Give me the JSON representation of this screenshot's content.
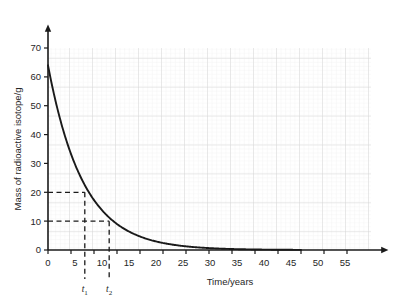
{
  "chart_data": {
    "type": "line",
    "title": "",
    "subtitle": "",
    "xlabel": "Time/years",
    "ylabel": "Mass of radioactive isotope/g",
    "xlim": [
      0,
      57
    ],
    "ylim": [
      0,
      73
    ],
    "xticks": [
      0,
      5,
      10,
      15,
      20,
      25,
      30,
      35,
      40,
      45,
      50,
      55
    ],
    "yticks": [
      0,
      10,
      20,
      30,
      40,
      50,
      60,
      70
    ],
    "grid": true,
    "grid_minor": true,
    "legend": "none",
    "curve_color": "#1a1a1a",
    "series": [
      {
        "name": "Mass of radioactive isotope",
        "initial_value": 64,
        "half_life": 5.3,
        "x": [
          0,
          1,
          2,
          3,
          4,
          5,
          6,
          7,
          8,
          9,
          10,
          11,
          12,
          13,
          14,
          15,
          16,
          18,
          20,
          22,
          25,
          28,
          30,
          33,
          36,
          40,
          44,
          48,
          52,
          55
        ],
        "values": [
          64,
          56.2,
          49.3,
          43.3,
          38.0,
          33.4,
          29.3,
          25.7,
          22.6,
          19.8,
          17.4,
          15.3,
          13.4,
          11.8,
          10.3,
          9.1,
          8.0,
          6.1,
          4.7,
          3.6,
          2.4,
          1.6,
          1.2,
          0.8,
          0.5,
          0.3,
          0.15,
          0.08,
          0.04,
          0.02
        ]
      }
    ],
    "annotations": [
      {
        "id": "t1",
        "label": "t",
        "subscript": "1",
        "x": 8,
        "y": 20,
        "style": "dashed-guideline"
      },
      {
        "id": "t2",
        "label": "t",
        "subscript": "2",
        "x": 13.3,
        "y": 10,
        "style": "dashed-guideline"
      }
    ]
  },
  "axes": {
    "x_axis_label": "Time/years",
    "y_axis_label": "Mass of radioactive isotope/g",
    "x_tick_labels": [
      "0",
      "5",
      "10",
      "15",
      "20",
      "25",
      "30",
      "35",
      "40",
      "45",
      "50",
      "55"
    ],
    "y_tick_labels": [
      "0",
      "10",
      "20",
      "30",
      "40",
      "50",
      "60",
      "70"
    ]
  },
  "markers": {
    "t1_label": "t",
    "t1_sub": "1",
    "t2_label": "t",
    "t2_sub": "2"
  },
  "colors": {
    "curve": "#1a1a1a",
    "axis": "#1a1a1a",
    "grid_major": "#dcdcdc",
    "grid_minor": "#ededed",
    "background": "#ffffff",
    "text": "#262626"
  }
}
